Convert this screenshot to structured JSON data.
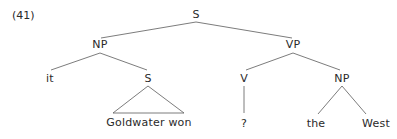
{
  "example_number": "(41)",
  "colors": {
    "line": "#5a5a5a",
    "text": "#2a2a2a",
    "background": "#ffffff"
  },
  "tree": {
    "root": {
      "label": "S",
      "x": 196,
      "y": 15
    },
    "np_subject": {
      "label": "NP",
      "x": 100,
      "y": 45
    },
    "vp": {
      "label": "VP",
      "x": 293,
      "y": 45
    },
    "pronoun": {
      "label": "it",
      "x": 50,
      "y": 79
    },
    "s_embedded": {
      "label": "S",
      "x": 148,
      "y": 79
    },
    "verb": {
      "label": "V",
      "x": 244,
      "y": 79
    },
    "np_object": {
      "label": "NP",
      "x": 342,
      "y": 79
    },
    "clause_text": {
      "label": "Goldwater won",
      "x": 149,
      "y": 123
    },
    "verb_word": {
      "label": "?",
      "x": 244,
      "y": 124
    },
    "det": {
      "label": "the",
      "x": 316,
      "y": 124
    },
    "noun": {
      "label": "West",
      "x": 376,
      "y": 124
    }
  }
}
